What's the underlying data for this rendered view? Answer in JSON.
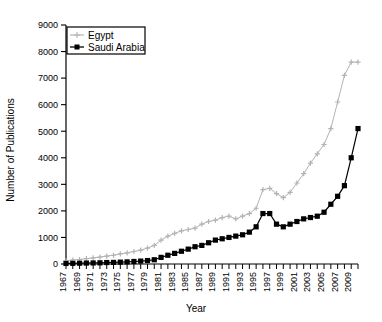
{
  "chart_data": {
    "type": "line",
    "title": "",
    "xlabel": "Year",
    "ylabel": "Number of Publications",
    "xlim": [
      1967,
      2010
    ],
    "ylim": [
      0,
      9000
    ],
    "ytick_labels": [
      "0",
      "1000",
      "2000",
      "3000",
      "4000",
      "5000",
      "6000",
      "7000",
      "8000",
      "9000"
    ],
    "ytick_values": [
      0,
      1000,
      2000,
      3000,
      4000,
      5000,
      6000,
      7000,
      8000,
      9000
    ],
    "xtick_labels": [
      "1967",
      "1969",
      "1971",
      "1973",
      "1975",
      "1977",
      "1979",
      "1981",
      "1983",
      "1985",
      "1987",
      "1989",
      "1991",
      "1993",
      "1995",
      "1997",
      "1999",
      "2001",
      "2003",
      "2005",
      "2007",
      "2009"
    ],
    "grid": false,
    "legend_position": "top-left",
    "x": [
      1967,
      1968,
      1969,
      1970,
      1971,
      1972,
      1973,
      1974,
      1975,
      1976,
      1977,
      1978,
      1979,
      1980,
      1981,
      1982,
      1983,
      1984,
      1985,
      1986,
      1987,
      1988,
      1989,
      1990,
      1991,
      1992,
      1993,
      1994,
      1995,
      1996,
      1997,
      1998,
      1999,
      2000,
      2001,
      2002,
      2003,
      2004,
      2005,
      2006,
      2007,
      2008,
      2009,
      2010
    ],
    "series": [
      {
        "name": "Egypt",
        "color": "#b3b3b3",
        "marker": "plus",
        "values": [
          120,
          150,
          170,
          200,
          230,
          260,
          300,
          330,
          380,
          420,
          470,
          520,
          600,
          700,
          900,
          1050,
          1150,
          1250,
          1300,
          1350,
          1500,
          1600,
          1650,
          1750,
          1800,
          1700,
          1800,
          1900,
          2100,
          2800,
          2850,
          2650,
          2500,
          2700,
          3050,
          3400,
          3800,
          4150,
          4500,
          5100,
          6100,
          7100,
          7600,
          7600
        ]
      },
      {
        "name": "Saudi Arabia",
        "color": "#000000",
        "marker": "square",
        "values": [
          20,
          25,
          30,
          35,
          40,
          45,
          55,
          60,
          70,
          80,
          95,
          110,
          130,
          160,
          250,
          330,
          400,
          480,
          560,
          650,
          700,
          800,
          900,
          950,
          1000,
          1050,
          1100,
          1200,
          1400,
          1900,
          1900,
          1500,
          1400,
          1500,
          1600,
          1700,
          1750,
          1800,
          1950,
          2250,
          2550,
          2950,
          4000,
          5100
        ]
      }
    ]
  },
  "legend": {
    "items": [
      {
        "label": "Egypt"
      },
      {
        "label": "Saudi Arabia"
      }
    ]
  }
}
